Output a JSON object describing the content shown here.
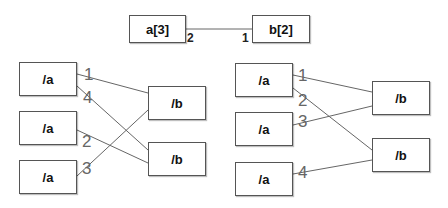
{
  "top": {
    "left_box": "a[3]",
    "right_box": "b[2]",
    "left_multiplicity": "2",
    "right_multiplicity": "1"
  },
  "left_diagram": {
    "a_boxes": [
      "/a",
      "/a",
      "/a"
    ],
    "b_boxes": [
      "/b",
      "/b"
    ],
    "edges": [
      {
        "from": 0,
        "to": 0,
        "label": "1"
      },
      {
        "from": 0,
        "to": 1,
        "label": "4"
      },
      {
        "from": 1,
        "to": 1,
        "label": "2"
      },
      {
        "from": 2,
        "to": 0,
        "label": "3"
      }
    ]
  },
  "right_diagram": {
    "a_boxes": [
      "/a",
      "/a",
      "/a"
    ],
    "b_boxes": [
      "/b",
      "/b"
    ],
    "edges": [
      {
        "from": 0,
        "to": 0,
        "label": "1"
      },
      {
        "from": 0,
        "to": 1,
        "label": "2"
      },
      {
        "from": 1,
        "to": 0,
        "label": "3"
      },
      {
        "from": 2,
        "to": 1,
        "label": "4"
      }
    ]
  }
}
